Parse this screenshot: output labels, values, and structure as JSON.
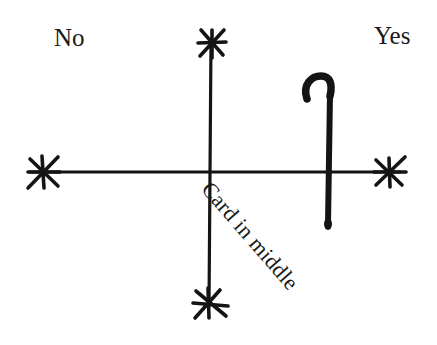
{
  "diagram": {
    "labels": {
      "no": "No",
      "yes": "Yes",
      "center": "Card in middle"
    },
    "elements": {
      "horizontal_axis": {
        "x1": 30,
        "y1": 172,
        "x2": 400,
        "y2": 172
      },
      "vertical_axis": {
        "x1": 211,
        "y1": 40,
        "x2": 209,
        "y2": 306
      },
      "stars": [
        {
          "name": "top",
          "cx": 212,
          "cy": 43
        },
        {
          "name": "bottom",
          "cx": 209,
          "cy": 303
        },
        {
          "name": "left",
          "cx": 43,
          "cy": 172
        },
        {
          "name": "right",
          "cx": 389,
          "cy": 172
        }
      ],
      "cane": {
        "shaft_x": 328,
        "top_y": 80,
        "bottom_y": 228
      }
    },
    "colors": {
      "ink": "#141414",
      "background": "#ffffff"
    }
  }
}
